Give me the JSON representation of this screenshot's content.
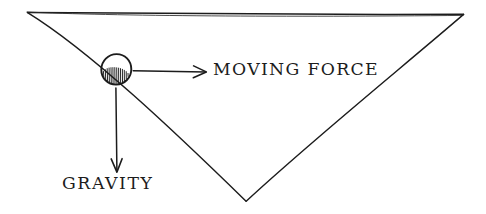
{
  "figure": {
    "kind": "hand-drawn-physics-sketch",
    "background_color": "#ffffff",
    "ink_color": "#1c1c1c",
    "width": 486,
    "height": 214
  },
  "labels": {
    "moving_force": "MOVING FORCE",
    "gravity": "GRAVITY"
  },
  "shapes": {
    "incline": {
      "name": "inverted-triangle-slope",
      "vertices": [
        [
          27,
          12
        ],
        [
          464,
          14
        ],
        [
          246,
          201
        ]
      ],
      "stroke_width": 1.4
    },
    "ball": {
      "name": "ball-on-slope",
      "center": [
        116,
        69
      ],
      "radius": 15,
      "stroke_width": 1.8,
      "shading": "vertical-hatch-lower-left",
      "hatch_count": 13
    }
  },
  "arrows": {
    "moving_force_arrow": {
      "name": "moving-force-arrow",
      "from": [
        133,
        71
      ],
      "to": [
        206,
        72
      ],
      "direction": "right",
      "head_length": 11,
      "head_half_width": 6,
      "stroke_width": 1.5
    },
    "gravity_arrow": {
      "name": "gravity-arrow",
      "from": [
        116,
        88
      ],
      "to": [
        117,
        172
      ],
      "direction": "down",
      "head_length": 13,
      "head_half_width": 5,
      "stroke_width": 1.5
    }
  }
}
